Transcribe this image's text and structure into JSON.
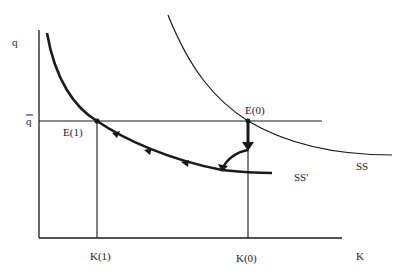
{
  "diagram": {
    "axes": {
      "y_label": "q",
      "x_label": "K"
    },
    "levels": {
      "q_bar": "q",
      "q_bar_overline": true
    },
    "points": {
      "e1": "E(1)",
      "e0": "E(0)"
    },
    "ticks": {
      "k1": "K(1)",
      "k0": "K(0)"
    },
    "curves": {
      "ss": "SS",
      "ss_prime": "SS'"
    },
    "colors": {
      "ink": "#1a1a1a",
      "background": "#ffffff"
    }
  }
}
